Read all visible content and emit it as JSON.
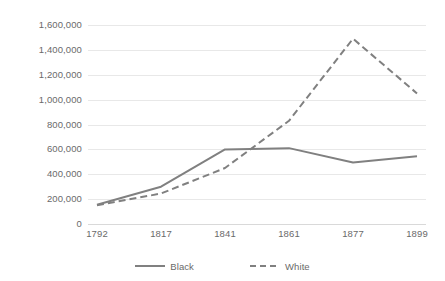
{
  "chart_data": {
    "type": "line",
    "title": "",
    "xlabel": "",
    "ylabel": "",
    "categories": [
      "1792",
      "1817",
      "1841",
      "1861",
      "1877",
      "1899"
    ],
    "x": [
      1792,
      1817,
      1841,
      1861,
      1877,
      1899
    ],
    "series": [
      {
        "name": "Black",
        "style": "solid",
        "color": "#808080",
        "values": [
          155000,
          300000,
          600000,
          610000,
          495000,
          545000
        ]
      },
      {
        "name": "White",
        "style": "dashed",
        "color": "#808080",
        "values": [
          150000,
          245000,
          450000,
          830000,
          1490000,
          1050000
        ]
      }
    ],
    "ylim": [
      0,
      1600000
    ],
    "ytick_labels": [
      "0",
      "200,000",
      "400,000",
      "600,000",
      "800,000",
      "1,000,000",
      "1,200,000",
      "1,400,000",
      "1,600,000"
    ],
    "ytick_values": [
      0,
      200000,
      400000,
      600000,
      800000,
      1000000,
      1200000,
      1400000,
      1600000
    ],
    "grid": true,
    "legend_position": "bottom",
    "legend_entries": [
      "Black",
      "White"
    ]
  },
  "colors": {
    "line": "#808080",
    "grid": "#e8e8e8",
    "axis": "#d9d9d9",
    "text": "#6a6a6a",
    "background": "#ffffff"
  }
}
